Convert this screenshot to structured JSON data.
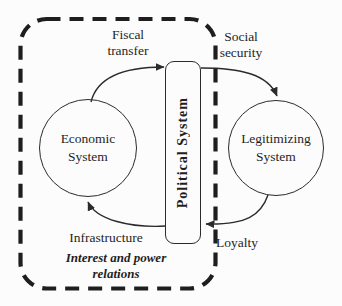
{
  "diagram": {
    "boundary_label": "Interest and power relations",
    "nodes": {
      "economic": "Economic System",
      "political": "Political System",
      "legitimizing": "Legitimizing System"
    },
    "flows": {
      "fiscal_transfer": "Fiscal transfer",
      "social_security": "Social security",
      "infrastructure": "Infrastructure",
      "loyalty": "Loyalty"
    },
    "colors": {
      "line": "#2b2b2b",
      "text": "#1f1f1f",
      "background": "#fcfcfc"
    }
  }
}
